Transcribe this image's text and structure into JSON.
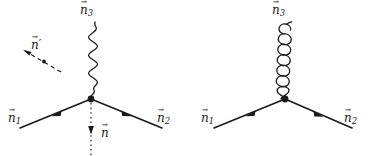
{
  "figure": {
    "background_color": "#ffffff",
    "line_color": "#1a1a1a",
    "width": 372,
    "height": 156
  },
  "diagrams": [
    {
      "id": "left-diagram",
      "boson_line": "wavy",
      "boson_label": "n",
      "boson_subscript": "3",
      "incoming_label": "n",
      "incoming_subscript": "1",
      "outgoing_label": "n",
      "outgoing_subscript": "2",
      "aux_vectors": [
        {
          "id": "n-prime",
          "label": "n",
          "prime": "′",
          "style": "dashed",
          "direction": "up-left"
        },
        {
          "id": "n-down",
          "label": "n",
          "prime": "",
          "style": "dotted",
          "direction": "down"
        }
      ]
    },
    {
      "id": "right-diagram",
      "boson_line": "coiled",
      "boson_label": "n",
      "boson_subscript": "3",
      "incoming_label": "n",
      "incoming_subscript": "1",
      "outgoing_label": "n",
      "outgoing_subscript": "2",
      "aux_vectors": []
    }
  ],
  "labels": {
    "left_n3": "n",
    "left_n3_sub": "3",
    "left_n1": "n",
    "left_n1_sub": "1",
    "left_n2": "n",
    "left_n2_sub": "2",
    "left_nprime": "n",
    "left_nprime_mark": "′",
    "left_n": "n",
    "right_n3": "n",
    "right_n3_sub": "3",
    "right_n1": "n",
    "right_n1_sub": "1",
    "right_n2": "n",
    "right_n2_sub": "2"
  }
}
